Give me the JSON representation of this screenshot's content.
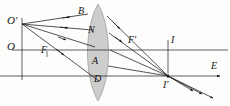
{
  "figure": {
    "kind": "optics-ray-diagram",
    "width": 230,
    "height": 106,
    "background_color": "#fdfdfc",
    "ink_color": "#1a1a1a",
    "lens_fill_color": "#c8c8c8",
    "lens_stroke_color": "#8a8a8a"
  },
  "labels": [
    {
      "id": "o-prime",
      "text": "O'",
      "x": 7,
      "y": 15,
      "size": "big"
    },
    {
      "id": "o",
      "text": "O",
      "x": 7,
      "y": 41,
      "size": "big"
    },
    {
      "id": "b",
      "text": "B",
      "x": 78,
      "y": 7,
      "size": "normal"
    },
    {
      "id": "n",
      "text": "N",
      "x": 88,
      "y": 26,
      "size": "normal"
    },
    {
      "id": "a",
      "text": "A",
      "x": 91,
      "y": 58,
      "size": "normal"
    },
    {
      "id": "d",
      "text": "D",
      "x": 93,
      "y": 76,
      "size": "normal"
    },
    {
      "id": "f",
      "text": "F",
      "x": 40,
      "y": 46,
      "size": "normal"
    },
    {
      "id": "f-prime",
      "text": "F'",
      "x": 128,
      "y": 36,
      "size": "normal"
    },
    {
      "id": "i",
      "text": "I",
      "x": 170,
      "y": 36,
      "size": "normal"
    },
    {
      "id": "i-prime",
      "text": "I'",
      "x": 163,
      "y": 82,
      "size": "normal"
    },
    {
      "id": "e",
      "text": "E",
      "x": 211,
      "y": 62,
      "size": "normal"
    }
  ],
  "points": {
    "object_top": {
      "name": "O'",
      "x": 22,
      "y": 24
    },
    "object_axis": {
      "name": "O",
      "x": 22,
      "y": 50
    },
    "focal_near": {
      "name": "F",
      "x": 47,
      "y": 54
    },
    "focal_far": {
      "name": "F'",
      "x": 133,
      "y": 50
    },
    "image_axis": {
      "name": "I",
      "x": 168,
      "y": 50
    },
    "image_point": {
      "name": "I'",
      "x": 168,
      "y": 76
    },
    "lens_top": {
      "name": "B",
      "x": 88,
      "y": 14
    },
    "lens_upper": {
      "name": "N",
      "x": 96,
      "y": 32
    },
    "lens_center": {
      "name": "A",
      "x": 98,
      "y": 63
    },
    "lens_lower": {
      "name": "D",
      "x": 100,
      "y": 82
    },
    "axis_end": {
      "name": "E",
      "x": 222,
      "y": 76
    }
  },
  "lens": {
    "center_x": 98,
    "top_y": 4,
    "bottom_y": 101,
    "half_width": 13
  },
  "axes": [
    {
      "id": "upper-axis",
      "label": "optical axis through O and I",
      "x1": 12,
      "y1": 50,
      "x2": 228,
      "y2": 50,
      "arrow": false
    },
    {
      "id": "lower-axis",
      "label": "principal axis through I' toward E",
      "x1": 0,
      "y1": 76,
      "x2": 224,
      "y2": 76,
      "arrow": true
    }
  ],
  "verticals": [
    {
      "id": "object-vertical",
      "label": "object height O'O",
      "x": 22,
      "y1": 18,
      "y2": 80
    },
    {
      "id": "image-vertical",
      "label": "image height I I'",
      "x": 168,
      "y1": 40,
      "y2": 80,
      "arrow": true
    }
  ],
  "incident_rays": [
    {
      "id": "ray-to-B",
      "from": "O'",
      "to": "B",
      "x1": 22,
      "y1": 24,
      "x2": 88,
      "y2": 14
    },
    {
      "id": "ray-to-N",
      "from": "O'",
      "to": "N",
      "x1": 22,
      "y1": 24,
      "x2": 92,
      "y2": 30
    },
    {
      "id": "ray-to-A",
      "from": "O'",
      "to": "A",
      "x1": 22,
      "y1": 24,
      "x2": 95,
      "y2": 47
    },
    {
      "id": "ray-through-F-to-D",
      "from": "O'",
      "to": "D",
      "x1": 22,
      "y1": 24,
      "x2": 98,
      "y2": 80
    }
  ],
  "refracted_rays": [
    {
      "id": "ray-B-to-I",
      "from": "B",
      "to": "I'",
      "x1": 108,
      "y1": 16,
      "x2": 168,
      "y2": 76
    },
    {
      "id": "ray-N-to-I",
      "from": "N",
      "to": "I'",
      "x1": 110,
      "y1": 34,
      "x2": 168,
      "y2": 76
    },
    {
      "id": "ray-A-to-I",
      "from": "A",
      "to": "I'",
      "x1": 111,
      "y1": 50,
      "x2": 168,
      "y2": 76
    },
    {
      "id": "ray-D-to-I",
      "from": "D",
      "to": "I'",
      "x1": 110,
      "y1": 66,
      "x2": 168,
      "y2": 76
    }
  ],
  "exit_rays": [
    {
      "id": "exit-ray-1",
      "from": "I'",
      "x1": 168,
      "y1": 76,
      "x2": 196,
      "y2": 92
    },
    {
      "id": "exit-ray-2",
      "from": "I'",
      "x1": 168,
      "y1": 76,
      "x2": 204,
      "y2": 95
    },
    {
      "id": "exit-ray-3",
      "from": "I'",
      "x1": 168,
      "y1": 76,
      "x2": 214,
      "y2": 99
    }
  ]
}
